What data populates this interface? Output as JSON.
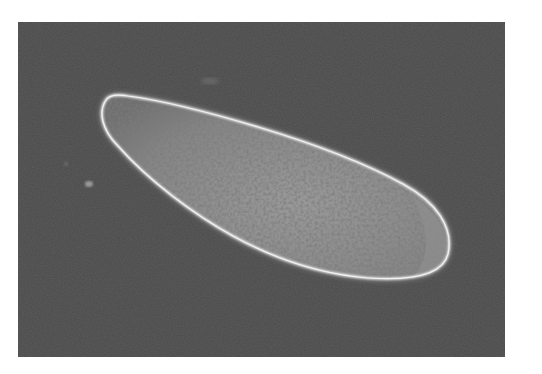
{
  "image": {
    "subject": "single-celled organism micrograph",
    "background_color": "#4a4a4a",
    "cell_rim_color": "#e6e6e6",
    "cell_body_color": "#8a8a8a",
    "page_background": "#ffffff"
  }
}
